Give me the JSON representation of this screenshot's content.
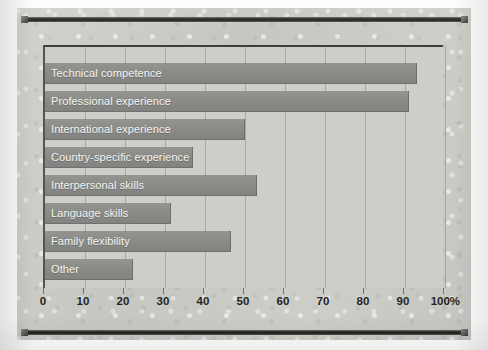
{
  "chart_data": {
    "type": "bar",
    "orientation": "horizontal",
    "title": "",
    "subtitle": "",
    "xlabel": "",
    "ylabel": "",
    "xlim": [
      0,
      100
    ],
    "xticks": [
      0,
      10,
      20,
      30,
      40,
      50,
      60,
      70,
      80,
      90,
      100
    ],
    "xtick_labels": [
      "0",
      "10",
      "20",
      "30",
      "40",
      "50",
      "60",
      "70",
      "80",
      "90",
      "100%"
    ],
    "grid": true,
    "legend": false,
    "unit": "%",
    "categories": [
      "Technical competence",
      "Professional experience",
      "International experience",
      "Country-specific experience",
      "Interpersonal skills",
      "Language skills",
      "Family flexibility",
      "Other"
    ],
    "values": [
      93,
      91,
      50,
      37,
      53,
      31.5,
      46.5,
      22
    ],
    "colors": {
      "bar": "#8b8b87",
      "plot_background": "#cdcdca",
      "page_background": "#c9c9c6",
      "gridline": "#a9a9a4",
      "axis_text": "#242422",
      "bar_label_text": "#f4f4f2",
      "rule": "#1d1d1c"
    }
  },
  "bars": [
    {
      "label": "Technical competence",
      "value": 93
    },
    {
      "label": "Professional experience",
      "value": 91
    },
    {
      "label": "International experience",
      "value": 50
    },
    {
      "label": "Country-specific experience",
      "value": 37
    },
    {
      "label": "Interpersonal skills",
      "value": 53
    },
    {
      "label": "Language skills",
      "value": 31.5
    },
    {
      "label": "Family flexibility",
      "value": 46.5
    },
    {
      "label": "Other",
      "value": 22
    }
  ],
  "axis": {
    "ticks": [
      {
        "value": 0,
        "label": "0"
      },
      {
        "value": 10,
        "label": "10"
      },
      {
        "value": 20,
        "label": "20"
      },
      {
        "value": 30,
        "label": "30"
      },
      {
        "value": 40,
        "label": "40"
      },
      {
        "value": 50,
        "label": "50"
      },
      {
        "value": 60,
        "label": "60"
      },
      {
        "value": 70,
        "label": "70"
      },
      {
        "value": 80,
        "label": "80"
      },
      {
        "value": 90,
        "label": "90"
      },
      {
        "value": 100,
        "label": "100%"
      }
    ]
  }
}
